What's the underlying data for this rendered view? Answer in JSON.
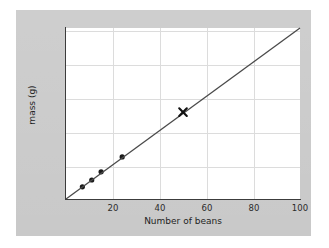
{
  "chart_data": {
    "type": "line",
    "title": "",
    "xlabel": "Number of beans",
    "ylabel": "mass (g)",
    "xlim": [
      0,
      100
    ],
    "ylim": [
      0,
      252
    ],
    "xticks": [
      20,
      40,
      60,
      80,
      100
    ],
    "yticks": [
      50,
      100,
      150,
      200,
      250
    ],
    "grid": true,
    "legend": null,
    "series": [
      {
        "name": "measured beans",
        "type": "scatter",
        "marker": "filled-circle",
        "color": "#1a1a1a",
        "x": [
          7,
          11,
          15,
          24
        ],
        "y": [
          18,
          28,
          40,
          62
        ]
      },
      {
        "name": "best fit line",
        "type": "line",
        "color": "#4a4a4a",
        "x": [
          0,
          100
        ],
        "y": [
          0,
          252
        ]
      },
      {
        "name": "predicted value",
        "type": "scatter",
        "marker": "cross-x",
        "color": "#111111",
        "x": [
          50
        ],
        "y": [
          128
        ]
      }
    ]
  },
  "axes": {
    "y_tick_labels": [
      "250",
      "200",
      "150",
      "100",
      "50"
    ],
    "x_tick_labels": [
      "20",
      "40",
      "60",
      "80",
      "100"
    ],
    "x_axis_title": "Number of beans",
    "y_axis_title": "mass (g)"
  },
  "colors": {
    "panel_background": "#c9c9c9",
    "plot_background": "#ffffff",
    "gridline": "#dcdcdc",
    "axis": "#3c3c3c",
    "line": "#4a4a4a",
    "marker": "#1a1a1a",
    "page_background": "#ffffff"
  }
}
